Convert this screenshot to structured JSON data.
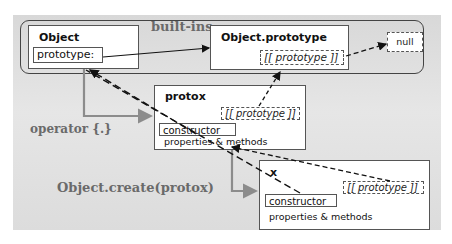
{
  "diagram": {
    "group_label": "built-ins",
    "operator_label": "operator {.}",
    "create_label": "Object.create(protox)",
    "nodes": {
      "object": {
        "title": "Object",
        "prototype_field": "prototype:"
      },
      "object_prototype": {
        "title": "Object.prototype",
        "proto_slot": "[[ prototype ]]"
      },
      "null": {
        "label": "null"
      },
      "protox": {
        "title": "protox",
        "proto_slot": "[[ prototype ]]",
        "constructor": "constructor",
        "members": "properties & methods"
      },
      "x": {
        "title": "x",
        "proto_slot": "[[ prototype ]]",
        "constructor": "constructor",
        "members": "properties & methods"
      }
    },
    "edges": [
      {
        "from": "Object.prototype:",
        "to": "Object.prototype",
        "style": "solid"
      },
      {
        "from": "Object.prototype [[prototype]]",
        "to": "null",
        "style": "dashed"
      },
      {
        "from": "protox [[prototype]]",
        "to": "Object.prototype",
        "style": "dashed"
      },
      {
        "from": "protox constructor",
        "to": "Object",
        "style": "long-dashed"
      },
      {
        "from": "x constructor",
        "to": "Object",
        "style": "long-dashed"
      },
      {
        "from": "x [[prototype]]",
        "to": "protox",
        "style": "dashed"
      },
      {
        "from": "Object",
        "to": "protox",
        "style": "gray-elbow",
        "label": "operator {.}"
      },
      {
        "from": "protox",
        "to": "x",
        "style": "gray-elbow",
        "label": "Object.create(protox)"
      }
    ],
    "colors": {
      "panel": "#e0e0e0",
      "gray_arrow": "#8c8c8c",
      "label_gray": "#6a6a6a",
      "line": "#222222"
    }
  }
}
